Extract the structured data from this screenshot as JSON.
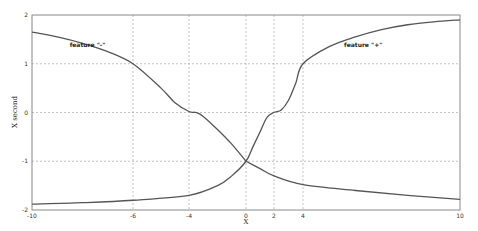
{
  "chart_data": {
    "type": "line",
    "title": "",
    "xlabel": "X",
    "ylabel": "X second",
    "xlim": [
      -10,
      10
    ],
    "ylim": [
      -2,
      2
    ],
    "grid": true,
    "x_ticks": [
      -10,
      -6,
      -4,
      0,
      2,
      4,
      10
    ],
    "y_ticks": [
      -2,
      -1,
      0,
      1,
      2
    ],
    "annotations": [
      {
        "text": "feature \"-\"",
        "x": -7.8,
        "y": 1.35
      },
      {
        "text": "feature \"+\"",
        "x": 6.3,
        "y": 1.35
      }
    ],
    "series": [
      {
        "name": "upper branch",
        "x": [
          -10,
          -9,
          -8,
          -7,
          -6,
          -5,
          -4.5,
          -4,
          -3.5,
          -3,
          -2,
          -1,
          0
        ],
        "y": [
          1.65,
          1.55,
          1.42,
          1.25,
          1.0,
          0.5,
          0.2,
          0.02,
          0.0,
          -0.08,
          -0.35,
          -0.65,
          -1.0
        ]
      },
      {
        "name": "lower-to-upper branch",
        "x": [
          -10,
          -8,
          -6,
          -4,
          -2,
          -1,
          0,
          0.5,
          1,
          1.5,
          2,
          2.5,
          3,
          3.5,
          4,
          5,
          6,
          7,
          8,
          9,
          10
        ],
        "y": [
          -1.88,
          -1.85,
          -1.8,
          -1.7,
          -1.5,
          -1.3,
          -1.0,
          -0.7,
          -0.4,
          -0.1,
          0.0,
          0.05,
          0.25,
          0.6,
          1.0,
          1.35,
          1.55,
          1.7,
          1.8,
          1.86,
          1.9
        ]
      },
      {
        "name": "decaying branch",
        "x": [
          0,
          1,
          2,
          4,
          6,
          8,
          10
        ],
        "y": [
          -1.0,
          -1.15,
          -1.3,
          -1.48,
          -1.6,
          -1.7,
          -1.78
        ]
      }
    ]
  },
  "axes": {
    "xlabel": "X",
    "ylabel": "X second",
    "x_tick_labels": [
      "-10",
      "-6",
      "-4",
      "0",
      "2",
      "4",
      "10"
    ],
    "y_tick_labels": [
      "-2",
      "-1",
      "0",
      "1",
      "2"
    ]
  },
  "style": {
    "line_color": "#555555",
    "grid_color": "#999999",
    "frame_color": "#888888"
  }
}
